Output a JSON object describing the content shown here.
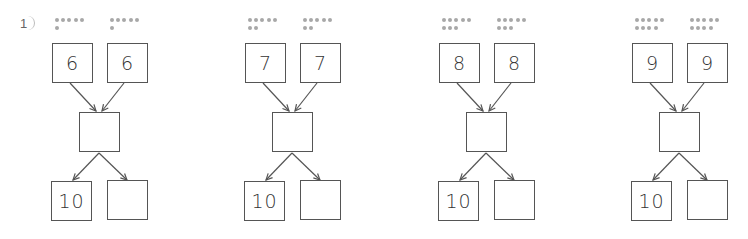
{
  "worksheet": {
    "question_number": "1",
    "problems": [
      {
        "dots_a": 6,
        "dots_b": 6,
        "addend_a": "6",
        "addend_b": "6",
        "sum": "",
        "split_ten": "10",
        "split_rest": ""
      },
      {
        "dots_a": 7,
        "dots_b": 7,
        "addend_a": "7",
        "addend_b": "7",
        "sum": "",
        "split_ten": "10",
        "split_rest": ""
      },
      {
        "dots_a": 8,
        "dots_b": 8,
        "addend_a": "8",
        "addend_b": "8",
        "sum": "",
        "split_ten": "10",
        "split_rest": ""
      },
      {
        "dots_a": 9,
        "dots_b": 9,
        "addend_a": "9",
        "addend_b": "9",
        "sum": "",
        "split_ten": "10",
        "split_rest": ""
      }
    ],
    "colors": {
      "line": "#555555",
      "dot": "#a8a8a8",
      "text": "#333333"
    }
  }
}
